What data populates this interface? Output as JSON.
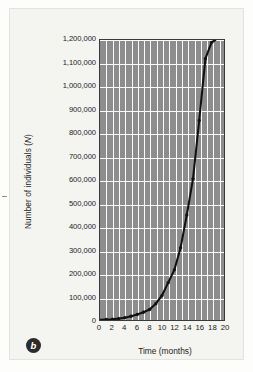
{
  "figure": {
    "panel_label": "b",
    "background_color": "#f4f4f1",
    "plot_background_color": "#8d8d8d",
    "gridline_color": "#fbfbfb",
    "curve_color": "#111111"
  },
  "chart_data": {
    "type": "line",
    "title": "",
    "subtitle": "",
    "xlabel": "Time (months)",
    "ylabel": "Number of individuals (N)",
    "ylabel_plain": "Number of individuals (",
    "ylabel_italic": "N",
    "ylabel_tail": ")",
    "xlim": [
      0,
      20
    ],
    "ylim": [
      0,
      1200000
    ],
    "grid": true,
    "legend": null,
    "x_ticks": [
      0,
      2,
      4,
      6,
      8,
      10,
      12,
      14,
      16,
      18,
      20
    ],
    "x_tick_labels": [
      "0",
      "2",
      "4",
      "6",
      "8",
      "10",
      "12",
      "14",
      "16",
      "18",
      "20"
    ],
    "y_ticks": [
      0,
      100000,
      200000,
      300000,
      400000,
      500000,
      600000,
      700000,
      800000,
      900000,
      1000000,
      1100000,
      1200000
    ],
    "y_tick_labels": [
      "0",
      "100,000",
      "200,000",
      "300,000",
      "400,000",
      "500,000",
      "600,000",
      "700,000",
      "800,000",
      "900,000",
      "1,000,000",
      "1,100,000",
      "1,200,000"
    ],
    "x": [
      0,
      1,
      2,
      3,
      4,
      5,
      6,
      7,
      8,
      9,
      10,
      11,
      12,
      13,
      14,
      15,
      16,
      17,
      18,
      18.6
    ],
    "values": [
      1000,
      2000,
      3500,
      6000,
      10000,
      16000,
      24000,
      33000,
      45000,
      70000,
      105000,
      160000,
      215000,
      310000,
      450000,
      605000,
      855000,
      1120000,
      1190000,
      1200000
    ],
    "marker": "dot",
    "marker_points_x": [
      1,
      2,
      3,
      4,
      5,
      6,
      7,
      8,
      9,
      10,
      11,
      12,
      13,
      14,
      15,
      16,
      17,
      18
    ],
    "marker_points_y": [
      2000,
      3500,
      6000,
      10000,
      16000,
      24000,
      33000,
      45000,
      70000,
      105000,
      160000,
      215000,
      310000,
      450000,
      605000,
      855000,
      1120000,
      1190000
    ]
  }
}
